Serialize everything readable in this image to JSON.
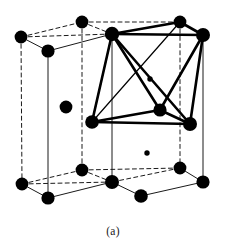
{
  "figure": {
    "caption": "(a)",
    "colors": {
      "atom": "#000000",
      "bond": "#000000",
      "edge_solid": "#1a1a1a",
      "edge_dashed": "#1a1a1a",
      "background": "#ffffff"
    },
    "style": {
      "atom_radius": 6.2,
      "small_atom_radius": 2.6,
      "edge_width": 1.0,
      "bond_width": 2.6
    }
  },
  "chart_data": {
    "type": "scatter",
    "xlabel": "",
    "ylabel": "",
    "atoms": [
      {
        "id": "T1",
        "label": "top-back-left",
        "x": 21,
        "y": 37,
        "r": 6.4,
        "layer": "top"
      },
      {
        "id": "T2",
        "label": "top-back-mid",
        "x": 82,
        "y": 22,
        "r": 6.4,
        "layer": "top"
      },
      {
        "id": "T3",
        "label": "top-back-right",
        "x": 180,
        "y": 22,
        "r": 6.4,
        "layer": "top"
      },
      {
        "id": "T4",
        "label": "top-right",
        "x": 203,
        "y": 35,
        "r": 7.0,
        "layer": "top"
      },
      {
        "id": "T5",
        "label": "top-center",
        "x": 112,
        "y": 34,
        "r": 7.2,
        "layer": "top"
      },
      {
        "id": "T6",
        "label": "top-front-left",
        "x": 48,
        "y": 51,
        "r": 6.6,
        "layer": "top"
      },
      {
        "id": "M1",
        "label": "mid-left-interior",
        "x": 66,
        "y": 107,
        "r": 6.4,
        "layer": "middle"
      },
      {
        "id": "M2",
        "label": "mid-front-left",
        "x": 92,
        "y": 122,
        "r": 6.8,
        "layer": "middle"
      },
      {
        "id": "M3",
        "label": "mid-center",
        "x": 160,
        "y": 110,
        "r": 6.6,
        "layer": "middle"
      },
      {
        "id": "M4",
        "label": "mid-front-right",
        "x": 190,
        "y": 124,
        "r": 7.0,
        "layer": "middle"
      },
      {
        "id": "S1",
        "label": "small-upper",
        "x": 150,
        "y": 79,
        "r": 2.7,
        "layer": "marker"
      },
      {
        "id": "S2",
        "label": "small-lower",
        "x": 147,
        "y": 153,
        "r": 2.7,
        "layer": "marker"
      },
      {
        "id": "B1",
        "label": "bottom-back-left",
        "x": 22,
        "y": 184,
        "r": 6.4,
        "layer": "bottom"
      },
      {
        "id": "B2",
        "label": "bottom-back-mid",
        "x": 82,
        "y": 170,
        "r": 6.4,
        "layer": "bottom"
      },
      {
        "id": "B3",
        "label": "bottom-back-right",
        "x": 180,
        "y": 168,
        "r": 6.4,
        "layer": "bottom"
      },
      {
        "id": "B4",
        "label": "bottom-right",
        "x": 203,
        "y": 182,
        "r": 6.6,
        "layer": "bottom"
      },
      {
        "id": "B5",
        "label": "bottom-center",
        "x": 112,
        "y": 182,
        "r": 7.0,
        "layer": "bottom"
      },
      {
        "id": "B6",
        "label": "bottom-front-left",
        "x": 48,
        "y": 198,
        "r": 6.6,
        "layer": "bottom"
      },
      {
        "id": "B7",
        "label": "bottom-front-right",
        "x": 141,
        "y": 196,
        "r": 6.8,
        "layer": "bottom"
      }
    ],
    "cell_edges_solid": [
      [
        "T1",
        "T6"
      ],
      [
        "T6",
        "T5"
      ],
      [
        "T5",
        "T4"
      ],
      [
        "T6",
        "B6"
      ],
      [
        "T5",
        "B5"
      ],
      [
        "T4",
        "B4"
      ],
      [
        "B1",
        "B6"
      ],
      [
        "B6",
        "B5"
      ],
      [
        "B5",
        "B7"
      ],
      [
        "B7",
        "B4"
      ],
      [
        "B4",
        "B3"
      ]
    ],
    "cell_edges_dashed": [
      [
        "T1",
        "T2"
      ],
      [
        "T2",
        "T3"
      ],
      [
        "T3",
        "T4"
      ],
      [
        "T1",
        "T5"
      ],
      [
        "T2",
        "T5"
      ],
      [
        "T3",
        "T5"
      ],
      [
        "T1",
        "B1"
      ],
      [
        "T2",
        "B2"
      ],
      [
        "T3",
        "B3"
      ],
      [
        "B1",
        "B2"
      ],
      [
        "B2",
        "B3"
      ],
      [
        "B1",
        "B5"
      ],
      [
        "B2",
        "B5"
      ],
      [
        "B3",
        "B5"
      ]
    ],
    "bonds_bold": [
      [
        "T5",
        "T3"
      ],
      [
        "T5",
        "T4"
      ],
      [
        "T5",
        "M2"
      ],
      [
        "T5",
        "M3"
      ],
      [
        "T5",
        "M4"
      ],
      [
        "T4",
        "M3"
      ],
      [
        "T4",
        "M4"
      ],
      [
        "M2",
        "M3"
      ],
      [
        "M2",
        "M4"
      ],
      [
        "M3",
        "M4"
      ],
      [
        "T3",
        "T4"
      ]
    ],
    "bonds_thin": [
      [
        "T5",
        "M2"
      ],
      [
        "M2",
        "T3"
      ]
    ],
    "legend": [],
    "grid": false
  }
}
